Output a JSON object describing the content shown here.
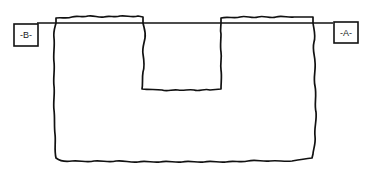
{
  "diagram": {
    "type": "line-drawing",
    "endpoints": [
      {
        "label": "-B-",
        "position": "left"
      },
      {
        "label": "-A-",
        "position": "right"
      }
    ],
    "stroke_color": "#111111",
    "background_color": "#ffffff"
  }
}
